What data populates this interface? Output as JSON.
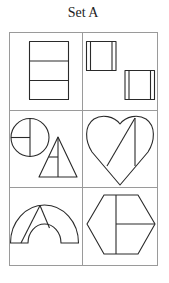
{
  "title": "Set A",
  "grid": {
    "rows": 3,
    "cols": 2
  },
  "cells": [
    {
      "id": "rectangle-three-parts",
      "description": "tall rectangle divided into three horizontal strips"
    },
    {
      "id": "two-squares-with-strips",
      "description": "two squares each with narrow vertical strips on both sides"
    },
    {
      "id": "circle-and-triangle",
      "description": "circle divided into parts and triangle divided into parts"
    },
    {
      "id": "heart-divided",
      "description": "heart shape divided by a diagonal and a vertical line"
    },
    {
      "id": "arch-divided",
      "description": "semicircular arch divided by two lines"
    },
    {
      "id": "hexagon-divided",
      "description": "hexagon divided by a vertical and a horizontal line"
    }
  ],
  "colors": {
    "stroke": "#2a2a2a",
    "grid": "#9a9a9a",
    "background": "#ffffff"
  }
}
